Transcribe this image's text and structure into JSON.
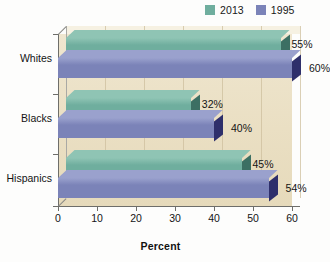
{
  "chart_data": {
    "type": "bar",
    "orientation": "horizontal",
    "title": "",
    "xlabel": "Percent",
    "ylabel": "",
    "xlim": [
      0,
      60
    ],
    "xticks": [
      0,
      10,
      20,
      30,
      40,
      50,
      60
    ],
    "grid": true,
    "legend_position": "top-right",
    "categories": [
      "Whites",
      "Blacks",
      "Hispanics"
    ],
    "series": [
      {
        "name": "2013",
        "color": "#6fae9e",
        "values": [
          55,
          32,
          45
        ],
        "labels": [
          "55%",
          "32%",
          "45%"
        ]
      },
      {
        "name": "1995",
        "color": "#7b83b8",
        "values": [
          60,
          40,
          54
        ],
        "labels": [
          "60%",
          "40%",
          "54%"
        ]
      }
    ]
  },
  "legend": {
    "entries": [
      {
        "label": "2013",
        "color": "#6fae9e"
      },
      {
        "label": "1995",
        "color": "#7b83b8"
      }
    ]
  },
  "axis": {
    "x_title": "Percent",
    "x_tick_labels": [
      "0",
      "10",
      "20",
      "30",
      "40",
      "50",
      "60"
    ],
    "category_labels": [
      "Whites",
      "Blacks",
      "Hispanics"
    ]
  },
  "values": {
    "whites_2013": "55%",
    "whites_1995": "60%",
    "blacks_2013": "32%",
    "blacks_1995": "40%",
    "hispanics_2013": "45%",
    "hispanics_1995": "54%"
  },
  "colors": {
    "series_2013": "#6fae9e",
    "series_2013_side": "#3c6f63",
    "series_2013_top": "#8fc4b4",
    "series_1995": "#7b83b8",
    "series_1995_side": "#2e2f6b",
    "series_1995_top": "#9aa1cd",
    "plot_background": "#ebdfc2",
    "page_background": "#fdfdfc",
    "axis": "#6e6e6a",
    "grid": "#cdbf9e"
  }
}
